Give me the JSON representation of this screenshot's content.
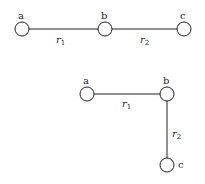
{
  "diagram1": {
    "nodes": [
      {
        "id": "a",
        "label": "a",
        "x": 22,
        "y": 29
      },
      {
        "id": "b",
        "label": "b",
        "x": 105,
        "y": 29
      },
      {
        "id": "c",
        "label": "c",
        "x": 184,
        "y": 29
      }
    ],
    "edges": [
      {
        "from": "a",
        "to": "b",
        "label": "r",
        "sub": "1"
      },
      {
        "from": "b",
        "to": "c",
        "label": "r",
        "sub": "2"
      }
    ]
  },
  "diagram2": {
    "nodes": [
      {
        "id": "a",
        "label": "a",
        "x": 87,
        "y": 94
      },
      {
        "id": "b",
        "label": "b",
        "x": 167,
        "y": 94
      },
      {
        "id": "c",
        "label": "c",
        "x": 167,
        "y": 165
      }
    ],
    "edges": [
      {
        "from": "a",
        "to": "b",
        "label": "r",
        "sub": "1"
      },
      {
        "from": "b",
        "to": "c",
        "label": "r",
        "sub": "2"
      }
    ]
  }
}
